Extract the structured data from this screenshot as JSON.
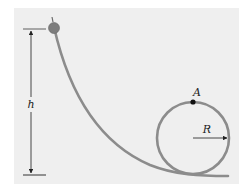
{
  "diagram": {
    "type": "roller-coaster-loop",
    "labels": {
      "height": "h",
      "point": "A",
      "radius": "R"
    },
    "colors": {
      "panel": "#efefef",
      "track": "#8c8c8c",
      "ball": "#7a7a7a",
      "lines": "#333333",
      "point": "#111111"
    }
  }
}
